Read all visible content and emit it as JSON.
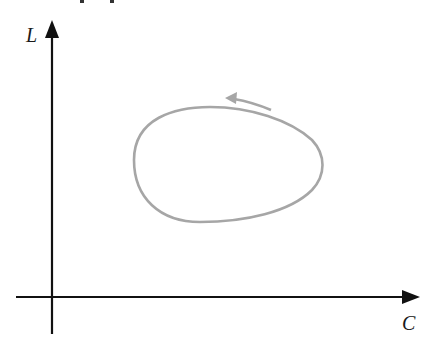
{
  "diagram": {
    "type": "phase-plot",
    "axes": {
      "y_label": "L",
      "x_label": "C",
      "color": "#111111"
    },
    "curve": {
      "shape": "closed egg-shaped loop",
      "color": "#a6a6a6",
      "direction": "counter-clockwise"
    },
    "direction_arrow": {
      "color": "#a6a6a6",
      "points": "left"
    }
  }
}
